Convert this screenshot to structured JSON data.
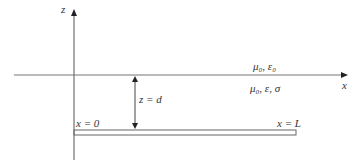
{
  "diagram": {
    "axes": {
      "z_label": "z",
      "x_label": "x"
    },
    "regions": {
      "upper": "μ₀, ε₀",
      "lower": "μ₀, ε, σ"
    },
    "dimension": {
      "label": "z = d"
    },
    "strip": {
      "left_label": "x = 0",
      "right_label": "x = L"
    },
    "colors": {
      "line": "#555555",
      "text": "#333333",
      "background": "#ffffff"
    }
  }
}
